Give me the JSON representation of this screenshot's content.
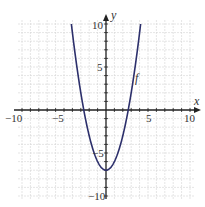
{
  "chart_data": {
    "type": "line",
    "title": "",
    "xlabel": "x",
    "ylabel": "y",
    "xlim": [
      -10,
      10
    ],
    "ylim": [
      -10,
      10
    ],
    "grid": true,
    "minor_grid_step": 1,
    "x_ticks": [
      -10,
      -5,
      5,
      10
    ],
    "y_ticks": [
      10,
      5,
      -5,
      -10
    ],
    "x_tick_labels": [
      "−10",
      "−5",
      "5",
      "10"
    ],
    "y_tick_labels": [
      "10",
      "5",
      "−5",
      "−10"
    ],
    "series": [
      {
        "name": "f",
        "equation": "f(x) = x^2 - 7",
        "color": "#2c2f6b",
        "vertex": [
          0,
          -7
        ],
        "x_intercepts": [
          -2.65,
          2.65
        ],
        "x": [
          -4.12,
          -4,
          -3,
          -2.65,
          -2,
          -1,
          0,
          1,
          2,
          2.65,
          3,
          4,
          4.12
        ],
        "y": [
          10,
          9,
          2,
          0,
          -3,
          -6,
          -7,
          -6,
          -3,
          0,
          2,
          9,
          10
        ]
      }
    ],
    "annotations": [
      {
        "text": "f",
        "x": 3.4,
        "y": 3.5
      }
    ]
  },
  "labels": {
    "x_axis": "x",
    "y_axis": "y",
    "curve": "f",
    "xt_m10": "−10",
    "xt_m5": "−5",
    "xt_5": "5",
    "xt_10": "10",
    "yt_10": "10",
    "yt_5": "5",
    "yt_m5": "−5",
    "yt_m10": "−10"
  },
  "colors": {
    "curve": "#2c2f6b",
    "axis": "#222222",
    "grid": "#d4d4d4"
  }
}
